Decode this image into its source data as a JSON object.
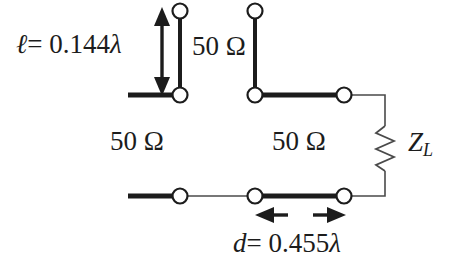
{
  "figure": {
    "type": "transmission-line-circuit-diagram",
    "stroke_color": "#1c1c1c",
    "thin_stroke_color": "#4a4a4a",
    "background_color": "#ffffff",
    "node_fill_color": "#ffffff"
  },
  "labels": {
    "stub_length": {
      "symbol": "ℓ",
      "equals": "=",
      "value": "0.144",
      "unit": "λ",
      "full": "ℓ = 0.144λ"
    },
    "stub_impedance": "50 Ω",
    "line_impedance_left": "50 Ω",
    "line_impedance_right": "50 Ω",
    "load": {
      "symbol": "Z",
      "subscript": "L",
      "full": "Z_L"
    },
    "stub_distance": {
      "symbol": "d",
      "equals": "=",
      "value": "0.455",
      "unit": "λ",
      "full": "d = 0.455λ"
    }
  },
  "elements": {
    "dimension_arrow_vertical": "double-headed-vertical-arrow",
    "dimension_arrow_horizontal": "outward-pointing-horizontal-arrows",
    "load_element": "zigzag-resistor",
    "terminals": "open-circle-terminal"
  }
}
